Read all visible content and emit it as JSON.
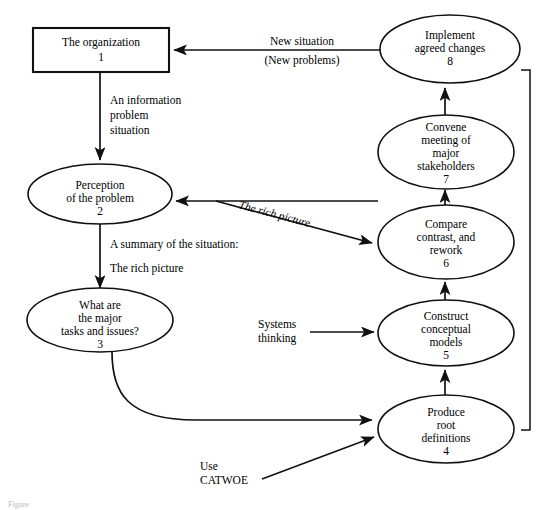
{
  "diagram": {
    "background_color": "#ffffff",
    "line_color": "#111111",
    "nodes": [
      {
        "id": "node-1",
        "shape": "rectangle",
        "number": "1",
        "lines": [
          "The organization"
        ],
        "line1": "The organization",
        "number_label": "1"
      },
      {
        "id": "node-2",
        "shape": "ellipse",
        "number": "2",
        "line1": "Perception",
        "line2": "of the problem",
        "number_label": "2"
      },
      {
        "id": "node-3",
        "shape": "ellipse",
        "number": "3",
        "line1": "What are",
        "line2": "the major",
        "line3": "tasks and issues?",
        "number_label": "3"
      },
      {
        "id": "node-4",
        "shape": "ellipse",
        "number": "4",
        "line1": "Produce",
        "line2": "root",
        "line3": "definitions",
        "number_label": "4"
      },
      {
        "id": "node-5",
        "shape": "ellipse",
        "number": "5",
        "line1": "Construct",
        "line2": "conceptual",
        "line3": "models",
        "number_label": "5"
      },
      {
        "id": "node-6",
        "shape": "ellipse",
        "number": "6",
        "line1": "Compare",
        "line2": "contrast, and",
        "line3": "rework",
        "number_label": "6"
      },
      {
        "id": "node-7",
        "shape": "ellipse",
        "number": "7",
        "line1": "Convene",
        "line2": "meeting of",
        "line3": "major",
        "line4": "stakeholders",
        "number_label": "7"
      },
      {
        "id": "node-8",
        "shape": "ellipse",
        "number": "8",
        "line1": "Implement",
        "line2": "agreed changes",
        "number_label": "8"
      }
    ],
    "edge_labels": {
      "new_situation_line1": "New situation",
      "new_situation_line2": "(New problems)",
      "an_information_line1": "An information",
      "an_information_line2": "problem",
      "an_information_line3": "situation",
      "summary_line1": "A summary of the situation:",
      "summary_line2": "The rich picture",
      "rich_picture": "The rich picture",
      "systems_line1": "Systems",
      "systems_line2": "thinking",
      "catwoe_line1": "Use",
      "catwoe_line2": "CATWOE"
    },
    "caption": "Figure"
  }
}
